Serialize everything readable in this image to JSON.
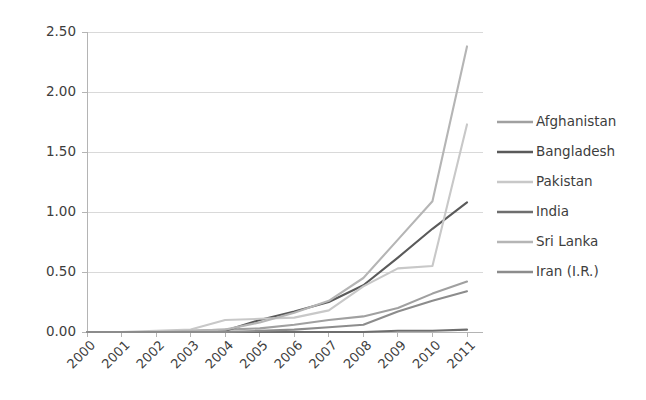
{
  "chart_data": {
    "type": "line",
    "title": "",
    "subtitle": "",
    "xlabel": "",
    "ylabel": "",
    "categories": [
      "2000",
      "2001",
      "2002",
      "2003",
      "2004",
      "2005",
      "2006",
      "2007",
      "2008",
      "2009",
      "2010",
      "2011"
    ],
    "ylim": [
      0.0,
      2.5
    ],
    "yticks": [
      0.0,
      0.5,
      1.0,
      1.5,
      2.0,
      2.5
    ],
    "ytick_labels": [
      "0.00",
      "0.50",
      "1.00",
      "1.50",
      "2.00",
      "2.50"
    ],
    "grid": true,
    "grid_axis": "y",
    "legend_position": "right",
    "series": [
      {
        "name": "Afghanistan",
        "color": "#a0a0a0",
        "values": [
          0.0,
          0.0,
          0.0,
          0.01,
          0.02,
          0.03,
          0.06,
          0.1,
          0.13,
          0.2,
          0.32,
          0.42
        ]
      },
      {
        "name": "Bangladesh",
        "color": "#5a5a5a",
        "values": [
          0.0,
          0.0,
          0.0,
          0.0,
          0.01,
          0.1,
          0.17,
          0.25,
          0.39,
          0.62,
          0.86,
          1.08
        ]
      },
      {
        "name": "Pakistan",
        "color": "#c8c8c8",
        "values": [
          0.0,
          0.0,
          0.01,
          0.02,
          0.1,
          0.11,
          0.12,
          0.18,
          0.38,
          0.53,
          0.55,
          1.73
        ]
      },
      {
        "name": "India",
        "color": "#6e6e6e",
        "values": [
          0.0,
          0.0,
          0.0,
          0.0,
          0.0,
          0.0,
          0.0,
          0.0,
          0.0,
          0.01,
          0.01,
          0.02
        ]
      },
      {
        "name": "Sri Lanka",
        "color": "#b5b5b5",
        "values": [
          0.0,
          0.0,
          0.0,
          0.01,
          0.02,
          0.08,
          0.16,
          0.26,
          0.45,
          0.77,
          1.09,
          2.38
        ]
      },
      {
        "name": "Iran (I.R.)",
        "color": "#8c8c8c",
        "values": [
          0.0,
          0.0,
          0.0,
          0.0,
          0.0,
          0.01,
          0.02,
          0.04,
          0.06,
          0.17,
          0.26,
          0.34
        ]
      }
    ]
  },
  "legend": {
    "items": [
      {
        "label": "Afghanistan"
      },
      {
        "label": "Bangladesh"
      },
      {
        "label": "Pakistan"
      },
      {
        "label": "India"
      },
      {
        "label": "Sri Lanka"
      },
      {
        "label": "Iran (I.R.)"
      }
    ]
  },
  "axes": {
    "y_labels": [
      "2.50",
      "2.00",
      "1.50",
      "1.00",
      "0.50",
      "0.00"
    ],
    "x_labels": [
      "2000",
      "2001",
      "2002",
      "2003",
      "2004",
      "2005",
      "2006",
      "2007",
      "2008",
      "2009",
      "2010",
      "2011"
    ]
  }
}
